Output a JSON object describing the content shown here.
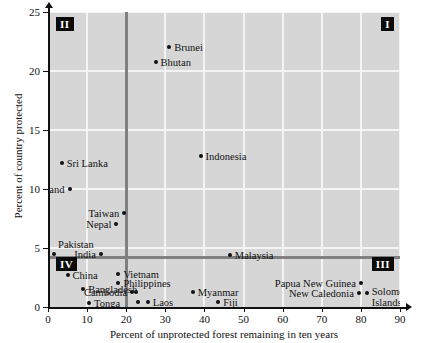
{
  "chart_data": {
    "type": "scatter",
    "title": "",
    "xlabel": "Percent of unprotected forest remaining in ten years",
    "ylabel": "Percent of country protected",
    "xlim": [
      0,
      90
    ],
    "ylim": [
      0,
      25
    ],
    "xticks": [
      0,
      10,
      20,
      30,
      40,
      50,
      60,
      70,
      80,
      90
    ],
    "yticks": [
      0,
      5,
      10,
      15,
      20,
      25
    ],
    "grid": true,
    "legend": "none",
    "reference_lines": {
      "vertical_x": 20,
      "horizontal_y": 4.2
    },
    "quadrant_labels": [
      {
        "name": "I",
        "position": "top-right"
      },
      {
        "name": "II",
        "position": "top-left"
      },
      {
        "name": "III",
        "position": "bottom-right"
      },
      {
        "name": "IV",
        "position": "bottom-left"
      }
    ],
    "points": [
      {
        "label": "Brunei",
        "x": 31.0,
        "y": 22.0,
        "label_side": "right"
      },
      {
        "label": "Bhutan",
        "x": 27.5,
        "y": 20.8,
        "label_side": "right"
      },
      {
        "label": "Indonesia",
        "x": 39.0,
        "y": 12.8,
        "label_side": "right"
      },
      {
        "label": "Sri Lanka",
        "x": 3.5,
        "y": 12.2,
        "label_side": "right"
      },
      {
        "label": "Thailand",
        "x": 5.5,
        "y": 10.0,
        "label_side": "left"
      },
      {
        "label": "Taiwan",
        "x": 19.5,
        "y": 8.0,
        "label_side": "left"
      },
      {
        "label": "Nepal",
        "x": 17.5,
        "y": 7.0,
        "label_side": "left"
      },
      {
        "label": "Pakistan",
        "x": 1.5,
        "y": 4.5,
        "label_side": "above"
      },
      {
        "label": "India",
        "x": 13.5,
        "y": 4.5,
        "label_side": "left"
      },
      {
        "label": "Malaysia",
        "x": 46.5,
        "y": 4.4,
        "label_side": "right"
      },
      {
        "label": "China",
        "x": 5.0,
        "y": 2.7,
        "label_side": "right"
      },
      {
        "label": "Vietnam",
        "x": 18.0,
        "y": 2.8,
        "label_side": "right"
      },
      {
        "label": "Philippines",
        "x": 18.0,
        "y": 2.0,
        "label_side": "right"
      },
      {
        "label": "Bangladesh",
        "x": 9.0,
        "y": 1.5,
        "label_side": "right"
      },
      {
        "label": "Cambodia",
        "x": 21.5,
        "y": 1.3,
        "label_side": "left"
      },
      {
        "label": "Myanmar",
        "x": 37.0,
        "y": 1.3,
        "label_side": "right"
      },
      {
        "label": "Tonga",
        "x": 10.5,
        "y": 0.3,
        "label_side": "right"
      },
      {
        "label": "Laos",
        "x": 25.5,
        "y": 0.4,
        "label_side": "right"
      },
      {
        "label": "Fiji",
        "x": 43.5,
        "y": 0.4,
        "label_side": "right"
      },
      {
        "label": "Papua New Guinea",
        "x": 80.0,
        "y": 2.0,
        "label_side": "left"
      },
      {
        "label": "New Caledonia",
        "x": 79.5,
        "y": 1.2,
        "label_side": "left"
      },
      {
        "label": "Solomon Islands",
        "x": 81.5,
        "y": 1.2,
        "label_side": "right"
      }
    ],
    "extra_markers": [
      {
        "x": 23.0,
        "y": 0.4
      },
      {
        "x": 22.5,
        "y": 1.3
      }
    ]
  },
  "axis": {
    "x_title": "Percent of unprotected forest remaining in ten years",
    "y_title": "Percent of country protected",
    "x_tick_labels": [
      "0",
      "10",
      "20",
      "30",
      "40",
      "50",
      "60",
      "70",
      "80",
      "90"
    ],
    "y_tick_labels": [
      "0",
      "5",
      "10",
      "15",
      "20",
      "25"
    ]
  },
  "quadrants": {
    "q1": "I",
    "q2": "II",
    "q3": "III",
    "q4": "IV"
  },
  "colors": {
    "plot_background": "#d6d6d6",
    "gridline": "#f4f4f4",
    "divider": "#808080",
    "marker": "#111111",
    "text": "#111111",
    "quadrant_badge_bg": "#0a0a0a",
    "quadrant_badge_text": "#ffffff"
  }
}
